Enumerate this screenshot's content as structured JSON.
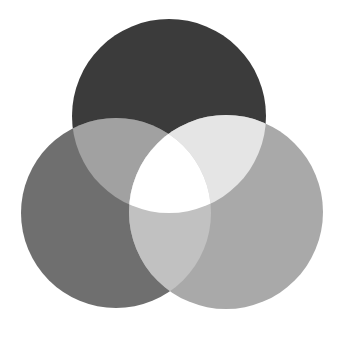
{
  "diagram": {
    "type": "venn-3",
    "background": "#ffffff",
    "circles": [
      {
        "id": "top",
        "cx": 169,
        "cy": 116,
        "r": 97,
        "color": "#3b3b3b"
      },
      {
        "id": "left",
        "cx": 116,
        "cy": 213,
        "r": 95,
        "color": "#6f6f6f"
      },
      {
        "id": "right",
        "cx": 226,
        "cy": 212,
        "r": 97,
        "color": "#a9a9a9"
      }
    ],
    "intersections": {
      "top_left": "#a1a1a1",
      "top_right": "#e5e5e5",
      "left_right": "#c1c1c1",
      "all_three": "#ffffff"
    }
  }
}
